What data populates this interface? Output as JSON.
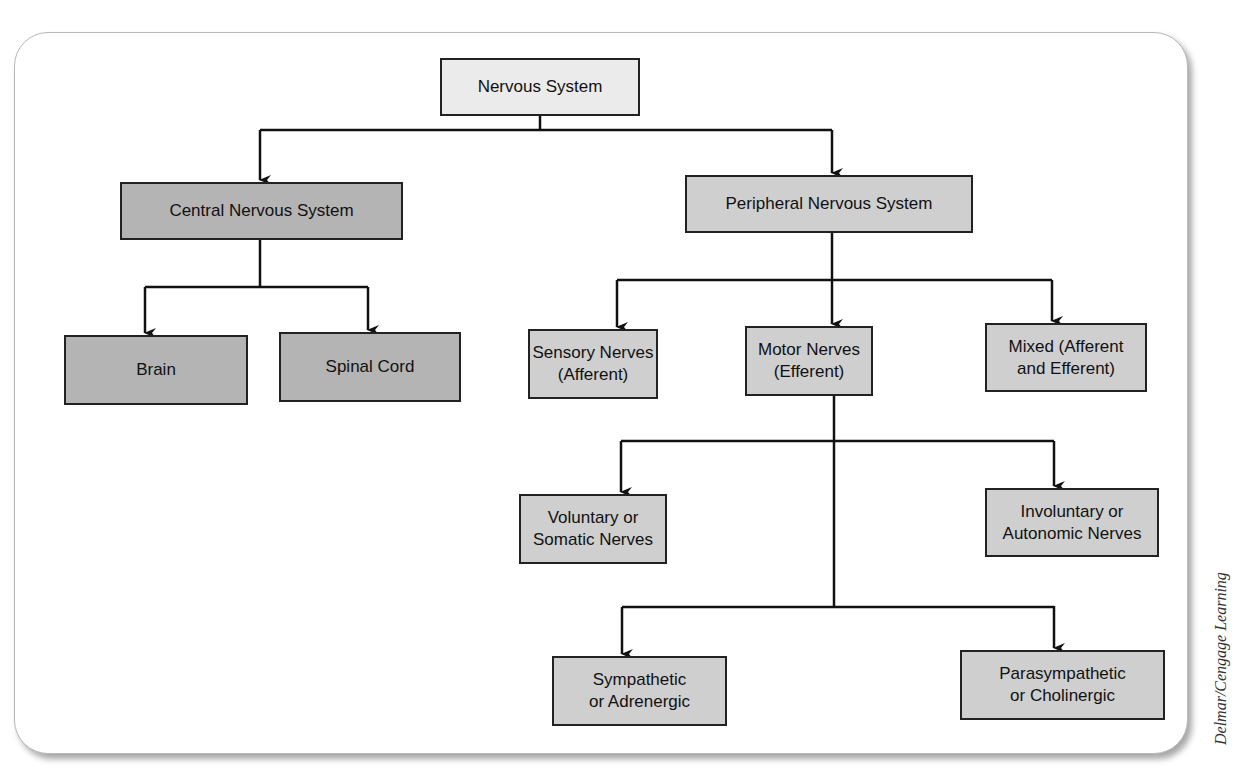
{
  "diagram": {
    "title": "Nervous System",
    "nodes": {
      "root": "Nervous System",
      "cns": "Central Nervous System",
      "pns": "Peripheral Nervous System",
      "brain": "Brain",
      "spinal_cord": "Spinal Cord",
      "sensory": "Sensory Nerves\n(Afferent)",
      "motor": "Motor Nerves\n(Efferent)",
      "mixed": "Mixed (Afferent\nand Efferent)",
      "voluntary": "Voluntary or\nSomatic Nerves",
      "involuntary": "Involuntary or\nAutonomic Nerves",
      "sympathetic": "Sympathetic\nor Adrenergic",
      "parasympathetic": "Parasympathetic\nor Cholinergic"
    },
    "edges": [
      [
        "root",
        "cns"
      ],
      [
        "root",
        "pns"
      ],
      [
        "cns",
        "brain"
      ],
      [
        "cns",
        "spinal_cord"
      ],
      [
        "pns",
        "sensory"
      ],
      [
        "pns",
        "motor"
      ],
      [
        "pns",
        "mixed"
      ],
      [
        "motor",
        "voluntary"
      ],
      [
        "motor",
        "involuntary"
      ],
      [
        "motor",
        "sympathetic"
      ],
      [
        "motor",
        "parasympathetic"
      ]
    ],
    "colors": {
      "root_fill": "#ebebeb",
      "cns_fill": "#b4b4b4",
      "pns_fill": "#cfcfcf",
      "line": "#111111"
    }
  },
  "credit": "Delmar/Cengage Learning"
}
